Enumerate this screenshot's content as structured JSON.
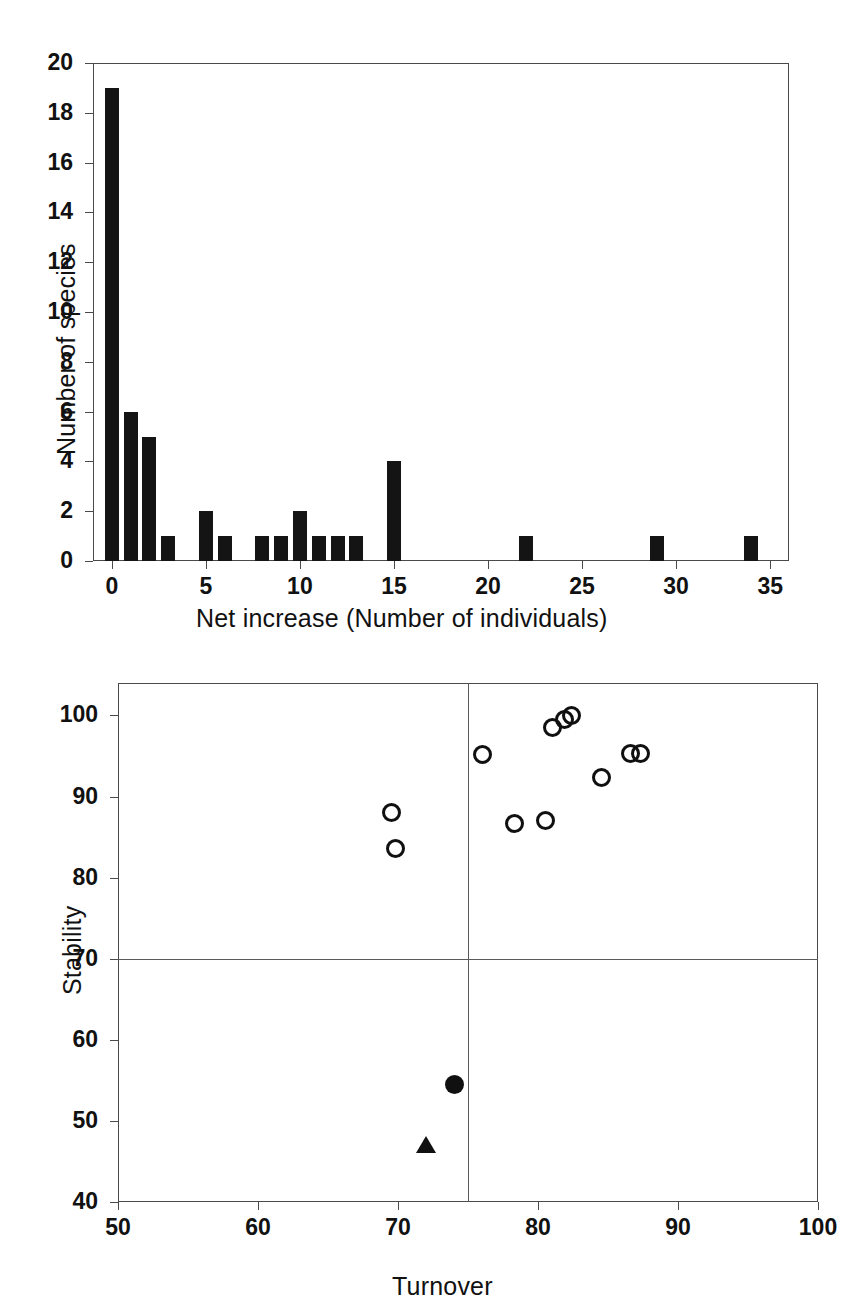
{
  "figure": {
    "background": "#ffffff",
    "ink_color": "#111111",
    "panel_count": 2
  },
  "chart_data": [
    {
      "id": "panel-a-histogram",
      "type": "bar",
      "title": "",
      "xlabel": "Net increase (Number of individuals)",
      "ylabel": "Number of species",
      "xlim": [
        -1,
        36
      ],
      "ylim": [
        0,
        20
      ],
      "xticks": [
        0,
        5,
        10,
        15,
        20,
        25,
        30,
        35
      ],
      "yticks": [
        0,
        2,
        4,
        6,
        8,
        10,
        12,
        14,
        16,
        18,
        20
      ],
      "xtick_labels": [
        "0",
        "5",
        "10",
        "15",
        "20",
        "25",
        "30",
        "35"
      ],
      "ytick_labels": [
        "0",
        "2",
        "4",
        "6",
        "8",
        "10",
        "12",
        "14",
        "16",
        "18",
        "20"
      ],
      "grid": false,
      "legend": null,
      "bar_color": "#141414",
      "categories": [
        0,
        1,
        2,
        3,
        5,
        6,
        8,
        9,
        10,
        11,
        12,
        13,
        15,
        22,
        29,
        34
      ],
      "values": [
        19,
        6,
        5,
        1,
        2,
        1,
        1,
        1,
        2,
        1,
        1,
        1,
        4,
        1,
        1,
        1
      ]
    },
    {
      "id": "panel-b-scatter",
      "type": "scatter",
      "title": "",
      "xlabel": "Turnover",
      "ylabel": "Stability",
      "xlim": [
        50,
        100
      ],
      "ylim": [
        40,
        104
      ],
      "xticks": [
        50,
        60,
        70,
        80,
        90,
        100
      ],
      "yticks": [
        40,
        50,
        60,
        70,
        80,
        90,
        100
      ],
      "xtick_labels": [
        "50",
        "60",
        "70",
        "80",
        "90",
        "100"
      ],
      "ytick_labels": [
        "40",
        "50",
        "60",
        "70",
        "80",
        "90",
        "100"
      ],
      "grid": false,
      "legend": null,
      "reference_lines": [
        {
          "orientation": "vertical",
          "value": 75
        },
        {
          "orientation": "horizontal",
          "value": 70
        }
      ],
      "series": [
        {
          "name": "open-circle",
          "marker": "open circle",
          "color": "#101010",
          "points": [
            {
              "x": 69.5,
              "y": 88.0
            },
            {
              "x": 69.8,
              "y": 83.6
            },
            {
              "x": 76.0,
              "y": 95.2
            },
            {
              "x": 78.3,
              "y": 86.7
            },
            {
              "x": 80.5,
              "y": 87.0
            },
            {
              "x": 81.0,
              "y": 98.5
            },
            {
              "x": 81.9,
              "y": 99.5
            },
            {
              "x": 82.4,
              "y": 100.0
            },
            {
              "x": 84.5,
              "y": 92.3
            },
            {
              "x": 86.6,
              "y": 95.3
            },
            {
              "x": 87.3,
              "y": 95.3
            }
          ]
        },
        {
          "name": "filled-circle",
          "marker": "filled circle",
          "color": "#101010",
          "points": [
            {
              "x": 74.0,
              "y": 54.5
            }
          ]
        },
        {
          "name": "filled-triangle",
          "marker": "filled triangle",
          "color": "#101010",
          "points": [
            {
              "x": 72.0,
              "y": 47.0
            }
          ]
        }
      ]
    }
  ]
}
